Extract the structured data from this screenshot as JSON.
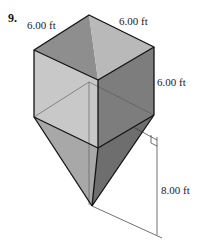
{
  "problem_number": "9.",
  "labels": {
    "top_left_edge": "6.00 ft",
    "top_right_edge": "6.00 ft",
    "vertical_edge": "6.00 ft",
    "pyramid_height": "8.00 ft"
  },
  "colors": {
    "top_left_face": "#8e8e8e",
    "top_right_face": "#b9b9b9",
    "front_left_face": "#c8c8c8",
    "front_right_face": "#7d7d7d",
    "pyr_left": "#a8a8a8",
    "pyr_right": "#6e6e6e",
    "edge": "#111111"
  }
}
